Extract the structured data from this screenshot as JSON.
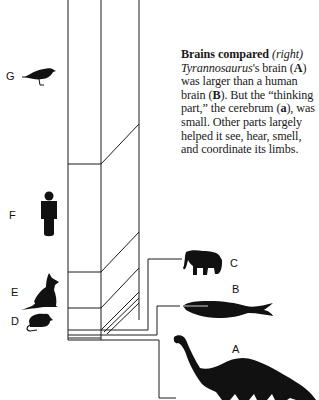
{
  "caption": {
    "title": "Brains compared",
    "title_note": "(right)",
    "genus": "Tyrannosaurus",
    "text_1": "'s brain (",
    "label_A": "A",
    "text_2": ") was larger than a human brain (",
    "label_B": "B",
    "text_3": "). But the “thinking part,” the cerebrum (",
    "label_a": "a",
    "text_4": "), was small. Other parts largely helped it see, hear, smell, and coordinate its limbs."
  },
  "figure_labels": {
    "G": "G",
    "F": "F",
    "E": "E",
    "D": "D",
    "C": "C",
    "B": "B",
    "A": "A"
  },
  "silhouettes": [
    {
      "key": "G",
      "icon": "bird-icon"
    },
    {
      "key": "F",
      "icon": "human-icon"
    },
    {
      "key": "E",
      "icon": "cat-icon"
    },
    {
      "key": "D",
      "icon": "mouse-icon"
    },
    {
      "key": "C",
      "icon": "elephant-icon"
    },
    {
      "key": "B",
      "icon": "whale-icon"
    },
    {
      "key": "A",
      "icon": "dinosaur-icon"
    }
  ],
  "colors": {
    "ink": "#111111",
    "background": "#ffffff"
  }
}
